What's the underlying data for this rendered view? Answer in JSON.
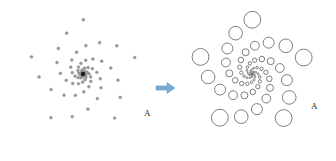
{
  "figure": {
    "background_color": "#ffffff",
    "width": 336,
    "height": 161
  },
  "arrow": {
    "name": "transformation-arrow",
    "direction": "right",
    "color": "#7aa9d6",
    "color_dark": "#5b93c9",
    "x": 156,
    "y": 88,
    "length": 19,
    "label": ""
  },
  "panels": [
    {
      "id": "left",
      "name": "source-point-pattern",
      "label": "A",
      "label_x": 144,
      "label_y": 116,
      "center_x": 83,
      "center_y": 74,
      "marker_type": "dot",
      "marker_color": "#8a8a8a",
      "marker_fill": "#9a9a9a",
      "marker_radius_constant": 1.4,
      "center_marker_color": "#1a1a1a",
      "center_marker_radius": 2.2,
      "arms": 5,
      "points_per_arm": 13,
      "spiral_a": 2.6,
      "spiral_b": 0.3,
      "spiral_rotation_deg": -18,
      "max_t": 3.05
    },
    {
      "id": "right",
      "name": "scaled-circle-pattern",
      "label": "A",
      "label_x": 311,
      "label_y": 109,
      "center_x": 252,
      "center_y": 74,
      "marker_type": "circle",
      "marker_color": "#6f6f6f",
      "marker_fill": "none",
      "marker_stroke_width": 0.9,
      "radius_scale": 0.155,
      "radius_min": 0.7,
      "center_marker_color": "#4a4a4a",
      "center_marker_radius": 1.0,
      "arms": 5,
      "points_per_arm": 13,
      "spiral_a": 2.6,
      "spiral_b": 0.3,
      "spiral_rotation_deg": -18,
      "max_t": 3.05
    }
  ],
  "chart_data": {
    "type": "scatter",
    "xlabel": "",
    "ylabel": "",
    "legend": [],
    "grid": false,
    "series": [
      {
        "name": "left-panel-dots",
        "marker": "dot",
        "marker_size_rule": "constant",
        "n_points": 65
      },
      {
        "name": "right-panel-circles",
        "marker": "open-circle",
        "marker_size_rule": "radius proportional to distance from centre",
        "n_points": 65
      }
    ]
  }
}
